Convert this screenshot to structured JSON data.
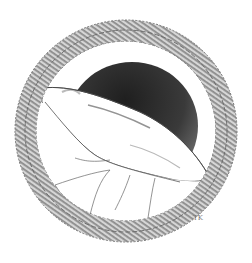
{
  "illustration": {
    "subject": "circular cross-section with hatched wall, dark lumen and white flap",
    "signature": "TK",
    "colors": {
      "background": "#ffffff",
      "wall_hatch_light": "#d9d9d9",
      "wall_hatch_dark": "#8a8a8a",
      "lumen_dark": "#2e2e2e",
      "lumen_mid": "#6a6a6a",
      "flap": "#ffffff",
      "lines": "#555555"
    }
  }
}
